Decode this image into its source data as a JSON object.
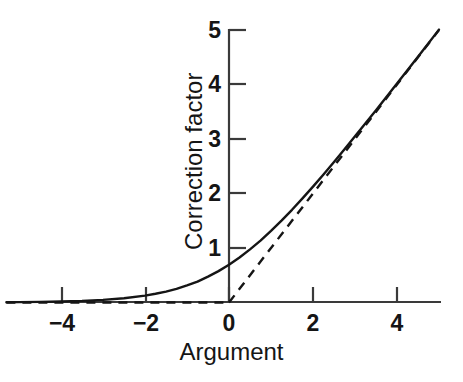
{
  "chart_data": {
    "type": "line",
    "title": "",
    "xlabel": "Argument",
    "ylabel": "Correction factor",
    "xlim": [
      -5.3,
      5.0
    ],
    "ylim": [
      0,
      5.0
    ],
    "grid": false,
    "legend": "none",
    "xticks": [
      -4,
      -2,
      0,
      2,
      4
    ],
    "xtick_labels": [
      "−4",
      "−2",
      "0",
      "2",
      "4"
    ],
    "yticks": [
      1,
      2,
      3,
      4,
      5
    ],
    "ytick_labels": [
      "1",
      "2",
      "3",
      "4",
      "5"
    ],
    "series": [
      {
        "name": "Correction factor",
        "style": "solid",
        "color": "#151515",
        "x": [
          -5.3,
          -5.0,
          -4.5,
          -4.0,
          -3.5,
          -3.0,
          -2.5,
          -2.0,
          -1.75,
          -1.5,
          -1.25,
          -1.0,
          -0.75,
          -0.5,
          -0.25,
          0.0,
          0.25,
          0.5,
          0.75,
          1.0,
          1.25,
          1.5,
          1.75,
          2.0,
          2.25,
          2.5,
          2.75,
          3.0,
          3.5,
          4.0,
          4.5,
          5.0
        ],
        "y": [
          0.005,
          0.007,
          0.011,
          0.018,
          0.029,
          0.049,
          0.079,
          0.127,
          0.161,
          0.201,
          0.249,
          0.313,
          0.383,
          0.474,
          0.576,
          0.693,
          0.826,
          0.974,
          1.134,
          1.313,
          1.501,
          1.701,
          1.911,
          2.127,
          2.349,
          2.579,
          2.812,
          3.049,
          3.529,
          4.018,
          4.511,
          5.007
        ]
      },
      {
        "name": "Asymptote y = 0 (x < 0)",
        "style": "dashed",
        "color": "#151515",
        "x": [
          -5.3,
          0.0
        ],
        "y": [
          0.0,
          0.0
        ]
      },
      {
        "name": "Asymptote y = x (x > 0)",
        "style": "dashed",
        "color": "#151515",
        "x": [
          0.0,
          5.0
        ],
        "y": [
          0.0,
          5.0
        ]
      }
    ],
    "annotations": []
  },
  "axes": {
    "x_title": "Argument",
    "y_title": "Correction factor"
  },
  "ticks": {
    "x": [
      {
        "value": -4,
        "label": "−4",
        "px": 62
      },
      {
        "value": -2,
        "label": "−2",
        "px": 146
      },
      {
        "value": 0,
        "label": "0",
        "px": 229
      },
      {
        "value": 2,
        "label": "2",
        "px": 313
      },
      {
        "value": 4,
        "label": "4",
        "px": 397
      }
    ],
    "y": [
      {
        "value": 1,
        "label": "1",
        "px": 248
      },
      {
        "value": 2,
        "label": "2",
        "px": 193
      },
      {
        "value": 3,
        "label": "3",
        "px": 139
      },
      {
        "value": 4,
        "label": "4",
        "px": 84
      },
      {
        "value": 5,
        "label": "5",
        "px": 30
      }
    ]
  },
  "style": {
    "background": "#ffffff",
    "ink": "#151515",
    "axis_color": "#3a3a3a"
  }
}
